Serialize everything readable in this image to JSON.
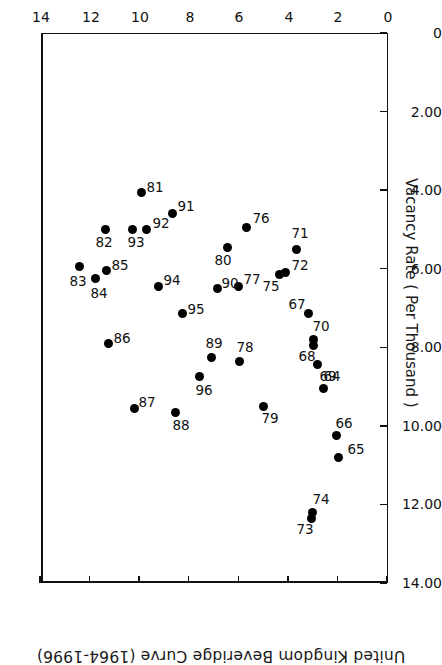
{
  "chart_data": {
    "type": "scatter",
    "title": "United Kingdom Beveridge Curve (1964-1996)",
    "subtitle": "",
    "xlabel": "Unemployment Rate",
    "ylabel": "Vacancy Rate ( Per Thousand )",
    "xlim": [
      0,
      14
    ],
    "ylim": [
      0,
      14
    ],
    "xticks": [
      0,
      2,
      4,
      6,
      8,
      10,
      12,
      14
    ],
    "xticklabels": [
      "0",
      "2",
      "4",
      "6",
      "8",
      "10",
      "12",
      "14"
    ],
    "yticks": [
      0,
      2,
      4,
      6,
      8,
      10,
      12,
      14
    ],
    "yticklabels": [
      "0",
      "2.00",
      "4.00",
      "6.00",
      "8.00",
      "10.00",
      "12.00",
      "14.00"
    ],
    "grid": false,
    "legend": "none",
    "rotation_deg": 180,
    "marker": "filled-circle",
    "marker_color": "#000000",
    "points": [
      {
        "label": "64",
        "x": 2.55,
        "y": 9.05
      },
      {
        "label": "65",
        "x": 1.95,
        "y": 10.8
      },
      {
        "label": "66",
        "x": 2.05,
        "y": 10.25
      },
      {
        "label": "67",
        "x": 3.15,
        "y": 7.15
      },
      {
        "label": "68",
        "x": 2.95,
        "y": 7.95
      },
      {
        "label": "69",
        "x": 2.8,
        "y": 8.45
      },
      {
        "label": "70",
        "x": 2.95,
        "y": 7.8
      },
      {
        "label": "71",
        "x": 3.65,
        "y": 5.5
      },
      {
        "label": "72",
        "x": 4.1,
        "y": 6.1
      },
      {
        "label": "73",
        "x": 3.05,
        "y": 12.35
      },
      {
        "label": "74",
        "x": 3.0,
        "y": 12.2
      },
      {
        "label": "75",
        "x": 4.35,
        "y": 6.15
      },
      {
        "label": "76",
        "x": 5.65,
        "y": 4.95
      },
      {
        "label": "77",
        "x": 6.0,
        "y": 6.45
      },
      {
        "label": "78",
        "x": 5.95,
        "y": 8.35
      },
      {
        "label": "79",
        "x": 5.0,
        "y": 9.5
      },
      {
        "label": "80",
        "x": 6.45,
        "y": 5.45
      },
      {
        "label": "81",
        "x": 9.9,
        "y": 4.05
      },
      {
        "label": "82",
        "x": 11.35,
        "y": 5.0
      },
      {
        "label": "83",
        "x": 12.4,
        "y": 5.95
      },
      {
        "label": "84",
        "x": 11.75,
        "y": 6.25
      },
      {
        "label": "85",
        "x": 11.3,
        "y": 6.05
      },
      {
        "label": "86",
        "x": 11.25,
        "y": 7.9
      },
      {
        "label": "87",
        "x": 10.2,
        "y": 9.55
      },
      {
        "label": "88",
        "x": 8.55,
        "y": 9.65
      },
      {
        "label": "89",
        "x": 7.1,
        "y": 8.25
      },
      {
        "label": "90",
        "x": 6.85,
        "y": 6.5
      },
      {
        "label": "91",
        "x": 8.65,
        "y": 4.6
      },
      {
        "label": "92",
        "x": 9.7,
        "y": 5.0
      },
      {
        "label": "93",
        "x": 10.25,
        "y": 5.0
      },
      {
        "label": "94",
        "x": 9.2,
        "y": 6.45
      },
      {
        "label": "95",
        "x": 8.25,
        "y": 7.15
      },
      {
        "label": "96",
        "x": 7.55,
        "y": 8.75
      }
    ],
    "label_offsets": {
      "64": [
        -8,
        13
      ],
      "65": [
        -17,
        8
      ],
      "66": [
        -8,
        13
      ],
      "67": [
        12,
        10
      ],
      "68": [
        7,
        -11
      ],
      "69": [
        -10,
        -11
      ],
      "70": [
        -7,
        13
      ],
      "71": [
        -3,
        16
      ],
      "72": [
        -15,
        8
      ],
      "73": [
        6,
        -11
      ],
      "74": [
        -8,
        13
      ],
      "75": [
        8,
        -11
      ],
      "76": [
        -14,
        9
      ],
      "77": [
        -14,
        7
      ],
      "78": [
        -5,
        14
      ],
      "79": [
        -7,
        -12
      ],
      "80": [
        4,
        -13
      ],
      "81": [
        -13,
        5
      ],
      "82": [
        2,
        -13
      ],
      "83": [
        2,
        -14
      ],
      "84": [
        -3,
        -14
      ],
      "85": [
        -13,
        6
      ],
      "86": [
        -14,
        5
      ],
      "87": [
        -13,
        6
      ],
      "88": [
        -6,
        -13
      ],
      "89": [
        -3,
        14
      ],
      "90": [
        -13,
        5
      ],
      "91": [
        -13,
        8
      ],
      "92": [
        -14,
        6
      ],
      "93": [
        -3,
        -13
      ],
      "94": [
        -13,
        6
      ],
      "95": [
        -13,
        5
      ],
      "96": [
        -4,
        -13
      ]
    }
  }
}
